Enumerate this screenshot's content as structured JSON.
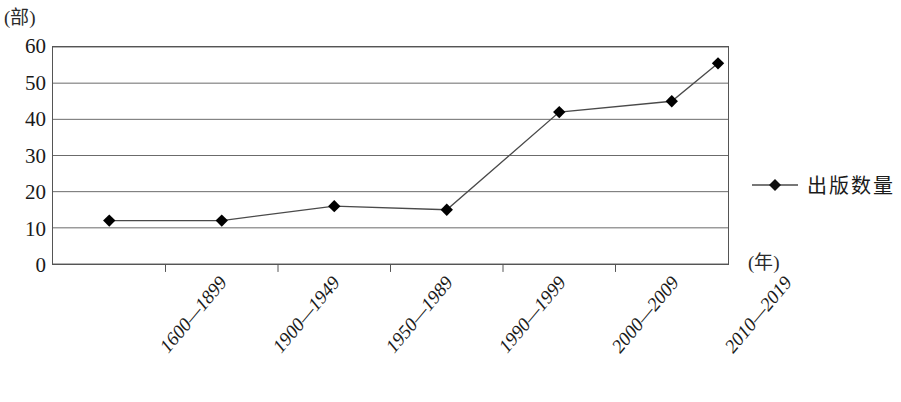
{
  "chart_data": {
    "type": "line",
    "title": "",
    "subtitle": "",
    "xlabel": "(年)",
    "ylabel": "(部)",
    "categories": [
      "1600—1899",
      "1900—1949",
      "1950—1989",
      "1990—1999",
      "2000—2009",
      "2010—2019"
    ],
    "series": [
      {
        "name": "出版数量",
        "values": [
          12,
          12,
          16,
          15,
          42,
          45
        ],
        "trailing_point": 55.5,
        "marker": "diamond",
        "color": "#000000"
      }
    ],
    "ylim": [
      0,
      60
    ],
    "ytick_step": 10,
    "yticks": [
      "0",
      "10",
      "20",
      "30",
      "40",
      "50",
      "60"
    ],
    "grid": "horizontal",
    "legend_position": "right",
    "legend_entries": [
      "出版数量"
    ],
    "axis_color": "#555555",
    "grid_color": "#6b6b6b",
    "background": "#ffffff"
  },
  "legend": {
    "marker_icon": "diamond-line-marker-icon",
    "label": "出版数量"
  },
  "axes": {
    "y_unit": "(部)",
    "x_unit": "(年)"
  }
}
